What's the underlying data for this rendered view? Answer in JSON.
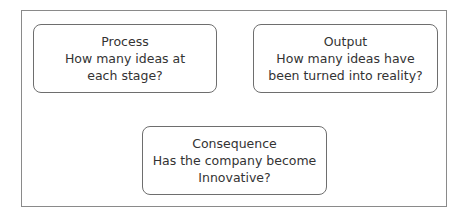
{
  "diagram": {
    "boxes": [
      {
        "id": "process",
        "title": "Process",
        "lines": [
          "How many ideas at",
          "each stage?"
        ]
      },
      {
        "id": "output",
        "title": "Output",
        "lines": [
          "How many ideas have",
          "been turned into reality?"
        ]
      },
      {
        "id": "consequence",
        "title": "Consequence",
        "lines": [
          "Has the company become",
          "Innovative?"
        ]
      }
    ]
  }
}
